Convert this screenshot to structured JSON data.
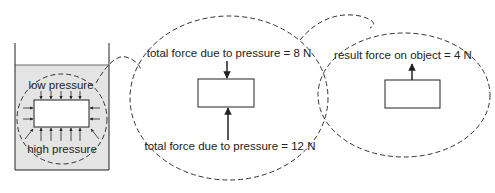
{
  "diagram": {
    "beaker": {
      "label_top": "low pressure",
      "label_bottom": "high pressure",
      "fluid_color": "#e4e4e4"
    },
    "middle_view": {
      "top_label": "total force due to pressure = 8 N",
      "bottom_label": "total force due to pressure = 12 N"
    },
    "right_view": {
      "label": "result force on object = 4 N"
    },
    "colors": {
      "line": "#222222",
      "dash": "#333333",
      "background": "#ffffff"
    }
  }
}
